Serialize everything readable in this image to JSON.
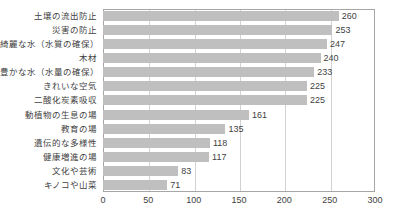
{
  "chart_data": {
    "type": "bar",
    "orientation": "horizontal",
    "title": "",
    "subtitle": "",
    "xlabel": "",
    "ylabel": "",
    "xlim": [
      0,
      300
    ],
    "xticks": [
      0,
      50,
      100,
      150,
      200,
      250,
      300
    ],
    "xtick_labels": [
      "0",
      "50",
      "100",
      "150",
      "200",
      "250",
      "300"
    ],
    "grid": true,
    "grid_axis": "x",
    "legend": false,
    "legend_position": "none",
    "bar_color": "#bfbfbf",
    "frame_color": "#a6a6a6",
    "gridline_color": "#d2d2d2",
    "text_color": "#3f3f3f",
    "show_value_labels": true,
    "categories": [
      "土壌の流出防止",
      "災害の防止",
      "綺麗な水（水質の確保）",
      "木材",
      "豊かな水（水量の確保）",
      "きれいな空気",
      "二酸化炭素吸収",
      "動植物の生息の場",
      "教育の場",
      "遺伝的な多様性",
      "健康増進の場",
      "文化や芸術",
      "キノコや山菜"
    ],
    "values": [
      260,
      253,
      247,
      240,
      233,
      225,
      225,
      161,
      135,
      118,
      117,
      83,
      71
    ],
    "value_labels": [
      "260",
      "253",
      "247",
      "240",
      "233",
      "225",
      "225",
      "161",
      "135",
      "118",
      "117",
      "83",
      "71"
    ]
  }
}
